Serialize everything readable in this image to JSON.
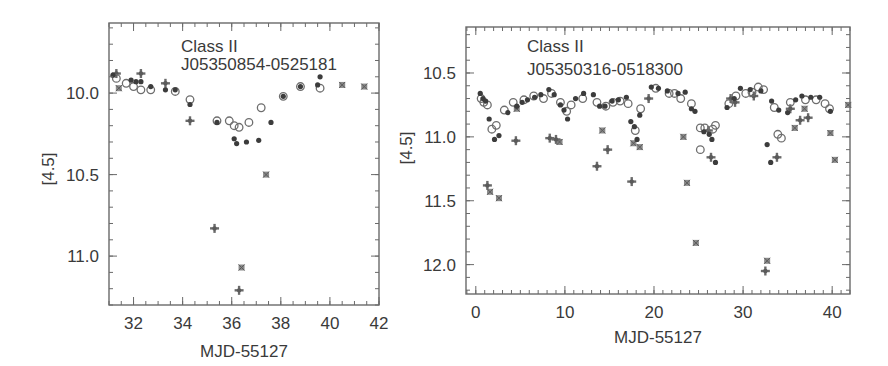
{
  "figure": {
    "panels": [
      {
        "annotation_line1": "Class II",
        "annotation_line2": "J05350854-0525181",
        "xlabel": "MJD-55127",
        "ylabel": "[4.5]"
      },
      {
        "annotation_line1": "Class II",
        "annotation_line2": "J05350316-0518300",
        "xlabel": "MJD-55127",
        "ylabel": "[4.5]"
      }
    ]
  },
  "chart_data": [
    {
      "type": "scatter",
      "title": "Class II J05350854-0525181",
      "xlabel": "MJD-55127",
      "ylabel": "[4.5]",
      "xlim": [
        31.0,
        42.0
      ],
      "ylim": [
        11.3,
        9.57
      ],
      "y_inverted": true,
      "xticks": [
        32,
        34,
        36,
        38,
        40,
        42
      ],
      "xtick_labels": [
        "32",
        "34",
        "36",
        "38",
        "40",
        "42"
      ],
      "yticks": [
        10.0,
        10.5,
        11.0
      ],
      "ytick_labels": [
        "10.0",
        "10.5",
        "11.0"
      ],
      "grid": false,
      "legend": null,
      "frame": {
        "x0": 109,
        "x1": 379,
        "y0": 23,
        "y1": 305
      },
      "series": [
        {
          "name": "filled-circle",
          "marker": "filled",
          "points": [
            [
              31.16,
              9.89
            ],
            [
              31.9,
              9.92
            ],
            [
              32.1,
              9.93
            ],
            [
              32.3,
              9.93
            ],
            [
              32.7,
              9.96
            ],
            [
              33.3,
              9.98
            ],
            [
              33.7,
              9.98
            ],
            [
              34.3,
              10.07
            ],
            [
              35.4,
              10.18
            ],
            [
              36.1,
              10.28
            ],
            [
              36.2,
              10.31
            ],
            [
              36.6,
              10.3
            ],
            [
              37.1,
              10.29
            ],
            [
              37.6,
              10.18
            ],
            [
              38.1,
              10.02
            ],
            [
              38.8,
              9.96
            ],
            [
              39.5,
              9.95
            ],
            [
              39.6,
              9.9
            ]
          ]
        },
        {
          "name": "open-circle",
          "marker": "open",
          "points": [
            [
              31.3,
              9.91
            ],
            [
              31.7,
              9.94
            ],
            [
              32.0,
              9.96
            ],
            [
              32.3,
              9.98
            ],
            [
              32.7,
              9.98
            ],
            [
              33.7,
              9.99
            ],
            [
              34.3,
              10.04
            ],
            [
              35.4,
              10.17
            ],
            [
              35.9,
              10.17
            ],
            [
              36.1,
              10.2
            ],
            [
              36.3,
              10.21
            ],
            [
              36.7,
              10.18
            ],
            [
              37.2,
              10.09
            ],
            [
              38.1,
              10.02
            ],
            [
              38.8,
              9.96
            ],
            [
              39.6,
              9.97
            ]
          ]
        },
        {
          "name": "plus",
          "marker": "plus",
          "points": [
            [
              31.3,
              9.88
            ],
            [
              32.3,
              9.88
            ],
            [
              33.3,
              9.94
            ],
            [
              34.3,
              10.17
            ],
            [
              35.3,
              10.83
            ],
            [
              36.3,
              11.21
            ]
          ]
        },
        {
          "name": "cross-square",
          "marker": "xsq",
          "points": [
            [
              31.4,
              9.97
            ],
            [
              37.4,
              10.5
            ],
            [
              36.4,
              11.07
            ],
            [
              40.5,
              9.95
            ],
            [
              41.4,
              9.96
            ]
          ]
        }
      ]
    },
    {
      "type": "scatter",
      "title": "Class II J05350316-0518300",
      "xlabel": "MJD-55127",
      "ylabel": "[4.5]",
      "xlim": [
        -1.1,
        42.0
      ],
      "ylim": [
        12.23,
        10.14
      ],
      "y_inverted": true,
      "xticks": [
        0,
        10,
        20,
        30,
        40
      ],
      "xtick_labels": [
        "0",
        "10",
        "20",
        "30",
        "40"
      ],
      "yticks": [
        10.5,
        11.0,
        11.5,
        12.0
      ],
      "ytick_labels": [
        "10.5",
        "11.0",
        "11.5",
        "12.0"
      ],
      "grid": false,
      "legend": null,
      "frame": {
        "x0": 466,
        "x1": 850,
        "y0": 27,
        "y1": 294
      },
      "series": [
        {
          "name": "filled-circle",
          "marker": "filled",
          "points": [
            [
              0.5,
              10.66
            ],
            [
              0.8,
              10.7
            ],
            [
              1.1,
              10.72
            ],
            [
              1.5,
              10.86
            ],
            [
              2.1,
              11.02
            ],
            [
              2.6,
              10.99
            ],
            [
              3.6,
              10.81
            ],
            [
              4.6,
              10.76
            ],
            [
              5.2,
              10.73
            ],
            [
              5.8,
              10.71
            ],
            [
              6.6,
              10.69
            ],
            [
              7.3,
              10.67
            ],
            [
              8.2,
              10.63
            ],
            [
              8.8,
              10.67
            ],
            [
              9.5,
              10.75
            ],
            [
              9.9,
              10.79
            ],
            [
              10.3,
              10.86
            ],
            [
              11.2,
              10.7
            ],
            [
              12.1,
              10.66
            ],
            [
              13.2,
              10.67
            ],
            [
              13.9,
              10.76
            ],
            [
              14.5,
              10.76
            ],
            [
              15.3,
              10.72
            ],
            [
              16.0,
              10.71
            ],
            [
              16.9,
              10.69
            ],
            [
              17.4,
              10.88
            ],
            [
              17.8,
              10.92
            ],
            [
              18.1,
              11.02
            ],
            [
              18.4,
              10.83
            ],
            [
              19.7,
              10.61
            ],
            [
              20.5,
              10.62
            ],
            [
              21.5,
              10.64
            ],
            [
              22.7,
              10.66
            ],
            [
              23.5,
              10.65
            ],
            [
              24.2,
              10.78
            ],
            [
              24.6,
              10.8
            ],
            [
              25.6,
              10.96
            ],
            [
              26.2,
              10.98
            ],
            [
              26.5,
              11.02
            ],
            [
              26.9,
              11.2
            ],
            [
              28.2,
              10.77
            ],
            [
              29.0,
              10.7
            ],
            [
              29.7,
              10.62
            ],
            [
              30.8,
              10.63
            ],
            [
              32.0,
              10.64
            ],
            [
              33.2,
              10.72
            ],
            [
              34.0,
              10.79
            ],
            [
              35.0,
              10.81
            ],
            [
              32.7,
              11.06
            ],
            [
              33.1,
              11.2
            ],
            [
              35.9,
              10.71
            ],
            [
              36.6,
              10.68
            ],
            [
              37.6,
              10.69
            ],
            [
              38.6,
              10.69
            ],
            [
              39.8,
              10.8
            ]
          ]
        },
        {
          "name": "open-circle",
          "marker": "open",
          "points": [
            [
              0.6,
              10.7
            ],
            [
              0.9,
              10.73
            ],
            [
              1.3,
              10.75
            ],
            [
              1.8,
              10.94
            ],
            [
              2.3,
              10.91
            ],
            [
              3.2,
              10.79
            ],
            [
              4.2,
              10.73
            ],
            [
              5.4,
              10.71
            ],
            [
              6.5,
              10.68
            ],
            [
              7.6,
              10.7
            ],
            [
              8.5,
              10.66
            ],
            [
              9.5,
              10.73
            ],
            [
              10.2,
              10.8
            ],
            [
              10.7,
              10.75
            ],
            [
              12.0,
              10.7
            ],
            [
              13.6,
              10.73
            ],
            [
              14.6,
              10.76
            ],
            [
              15.4,
              10.73
            ],
            [
              16.2,
              10.72
            ],
            [
              17.1,
              10.74
            ],
            [
              17.9,
              10.95
            ],
            [
              18.5,
              10.78
            ],
            [
              20.2,
              10.62
            ],
            [
              21.7,
              10.66
            ],
            [
              22.3,
              10.66
            ],
            [
              23.0,
              10.7
            ],
            [
              24.2,
              10.74
            ],
            [
              25.2,
              10.93
            ],
            [
              25.7,
              10.93
            ],
            [
              26.6,
              10.94
            ],
            [
              26.9,
              10.91
            ],
            [
              28.4,
              10.74
            ],
            [
              29.2,
              10.68
            ],
            [
              30.3,
              10.66
            ],
            [
              31.0,
              10.65
            ],
            [
              31.7,
              10.61
            ],
            [
              32.3,
              10.63
            ],
            [
              33.5,
              10.77
            ],
            [
              33.9,
              10.98
            ],
            [
              34.3,
              11.01
            ],
            [
              35.3,
              10.73
            ],
            [
              37.0,
              10.71
            ],
            [
              38.2,
              10.71
            ],
            [
              39.2,
              10.74
            ],
            [
              39.7,
              10.78
            ],
            [
              25.2,
              11.1
            ]
          ]
        },
        {
          "name": "plus",
          "marker": "plus",
          "points": [
            [
              1.3,
              11.38
            ],
            [
              4.5,
              11.03
            ],
            [
              8.3,
              11.01
            ],
            [
              9.0,
              11.02
            ],
            [
              13.6,
              11.23
            ],
            [
              14.8,
              11.1
            ],
            [
              17.5,
              11.35
            ],
            [
              19.4,
              10.7
            ],
            [
              26.1,
              10.95
            ],
            [
              26.4,
              11.16
            ],
            [
              28.6,
              10.7
            ],
            [
              29.1,
              10.73
            ],
            [
              31.2,
              10.68
            ],
            [
              32.5,
              12.05
            ],
            [
              33.8,
              11.16
            ],
            [
              35.3,
              10.78
            ],
            [
              36.4,
              10.87
            ],
            [
              37.3,
              10.85
            ]
          ]
        },
        {
          "name": "cross-square",
          "marker": "xsq",
          "points": [
            [
              1.6,
              11.43
            ],
            [
              2.6,
              11.48
            ],
            [
              4.6,
              10.78
            ],
            [
              9.4,
              11.04
            ],
            [
              14.2,
              10.95
            ],
            [
              17.7,
              11.05
            ],
            [
              18.4,
              11.08
            ],
            [
              23.3,
              11.0
            ],
            [
              23.7,
              11.36
            ],
            [
              24.7,
              11.83
            ],
            [
              32.7,
              11.97
            ],
            [
              35.8,
              10.93
            ],
            [
              36.9,
              10.78
            ],
            [
              39.8,
              10.97
            ],
            [
              41.8,
              10.75
            ],
            [
              40.3,
              11.18
            ]
          ]
        }
      ]
    }
  ]
}
